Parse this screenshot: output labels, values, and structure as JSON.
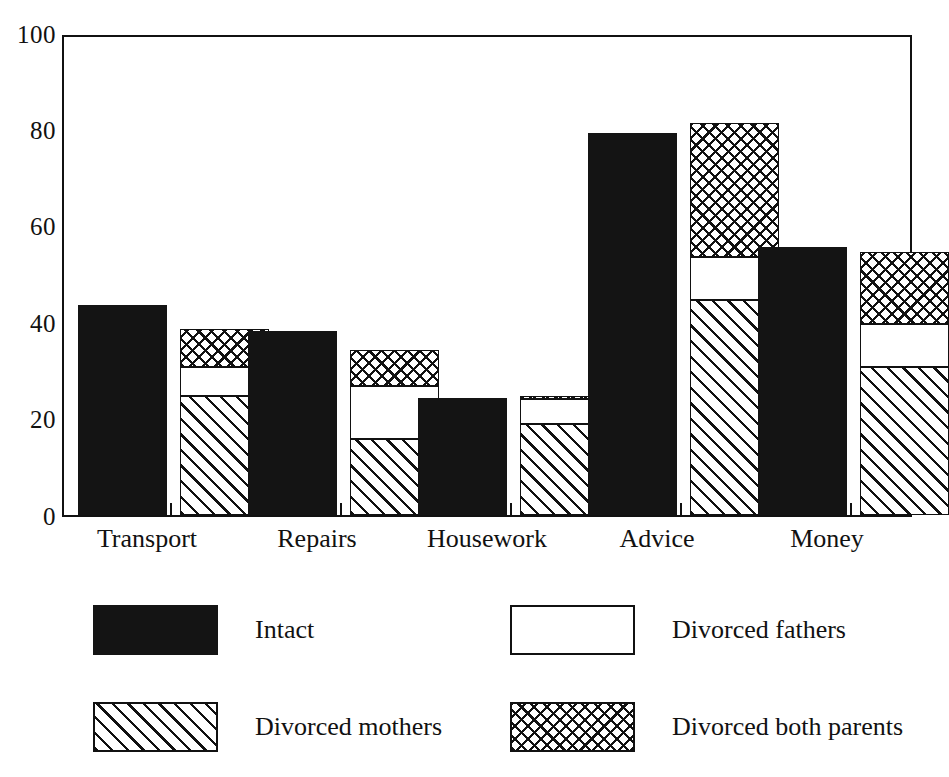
{
  "chart_data": {
    "type": "bar",
    "subtype": "grouped-stacked",
    "title": "",
    "subtitle": "",
    "xlabel": "",
    "ylabel": "",
    "ylim": [
      0,
      100
    ],
    "yticks": [
      0,
      20,
      40,
      60,
      80,
      100
    ],
    "ytick_labels": [
      "0",
      "20",
      "40",
      "60",
      "80",
      "100"
    ],
    "grid": false,
    "legend_position": "bottom",
    "categories": [
      "Transport",
      "Repairs",
      "Housework",
      "Advice",
      "Money"
    ],
    "series": [
      {
        "name": "Intact",
        "pattern": "solid-black",
        "stacked": false,
        "values": [
          44,
          38.5,
          24.5,
          80,
          56
        ]
      },
      {
        "name": "Divorced mothers",
        "pattern": "diagonal-hatch",
        "stacked": true,
        "values": [
          25,
          16,
          19,
          45,
          31
        ]
      },
      {
        "name": "Divorced fathers",
        "pattern": "white",
        "stacked": true,
        "values": [
          6,
          11,
          5.3,
          9,
          9
        ]
      },
      {
        "name": "Divorced both parents",
        "pattern": "crosshatch",
        "stacked": true,
        "values": [
          8,
          7.5,
          0.7,
          28,
          15
        ]
      }
    ],
    "stack_cumulative_tops": [
      {
        "category": "Transport",
        "mothers": 25,
        "fathers": 31,
        "both": 39
      },
      {
        "category": "Repairs",
        "mothers": 16,
        "fathers": 27,
        "both": 34.5
      },
      {
        "category": "Housework",
        "mothers": 19,
        "fathers": 24.3,
        "both": 25
      },
      {
        "category": "Advice",
        "mothers": 45,
        "fathers": 54,
        "both": 82
      },
      {
        "category": "Money",
        "mothers": 31,
        "fathers": 40,
        "both": 55
      }
    ]
  },
  "axis": {
    "y_labels": [
      "100",
      "80",
      "60",
      "40",
      "20",
      "0"
    ]
  },
  "x_labels": {
    "c0": "Transport",
    "c1": "Repairs",
    "c2": "Housework",
    "c3": "Advice",
    "c4": "Money"
  },
  "legend": {
    "items": [
      {
        "label": "Intact",
        "pattern": "solid-black"
      },
      {
        "label": "Divorced fathers",
        "pattern": "white"
      },
      {
        "label": "Divorced mothers",
        "pattern": "diagonal-hatch"
      },
      {
        "label": "Divorced both parents",
        "pattern": "crosshatch"
      }
    ],
    "intact_label": "Intact",
    "fathers_label": "Divorced fathers",
    "mothers_label": "Divorced mothers",
    "both_label": "Divorced both parents"
  },
  "colors": {
    "ink": "#111111",
    "solid_fill": "#141414",
    "paper": "#ffffff"
  }
}
